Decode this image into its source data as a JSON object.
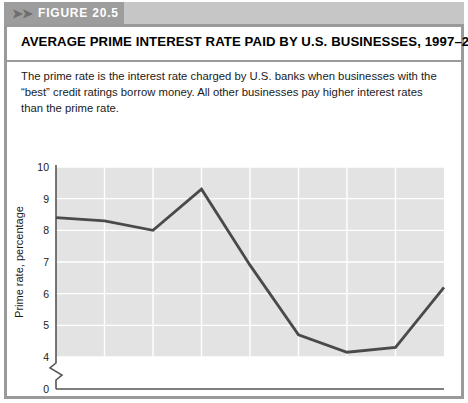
{
  "figure": {
    "badge_chevrons": "➤➤",
    "badge_label": "FIGURE  20.5",
    "title": "AVERAGE PRIME INTEREST RATE PAID BY U.S. BUSINESSES, 1997–2005",
    "caption": "The prime rate is the interest rate charged by U.S. banks when businesses with the “best” credit ratings borrow money. All other businesses pay higher interest rates than the prime rate."
  },
  "colors": {
    "band": "#c6c6c6",
    "badge": "#9d9d9d",
    "border": "#9a9a9a",
    "plot_background": "#e3e3e3",
    "gridline": "#ffffff",
    "line": "#4a4a4a",
    "axis": "#555555",
    "text": "#1a1a1a"
  },
  "chart_data": {
    "type": "line",
    "title": "AVERAGE PRIME INTEREST RATE PAID BY U.S. BUSINESSES, 1997–2005",
    "xlabel": "Year",
    "ylabel": "Prime rate, percentage",
    "x": [
      1997,
      1998,
      1999,
      2000,
      2001,
      2002,
      2003,
      2004,
      2005
    ],
    "categories": [
      "1997",
      "1998",
      "1999",
      "2000",
      "2001",
      "2002",
      "2003",
      "2004",
      "2005"
    ],
    "values": [
      8.4,
      8.3,
      8.0,
      9.3,
      6.9,
      4.7,
      4.15,
      4.3,
      6.2
    ],
    "series": [
      {
        "name": "Prime rate",
        "values": [
          8.4,
          8.3,
          8.0,
          9.3,
          6.9,
          4.7,
          4.15,
          4.3,
          6.2
        ]
      }
    ],
    "xlim": [
      1997,
      2005
    ],
    "ylim": [
      4,
      10
    ],
    "yticks": [
      0,
      4,
      5,
      6,
      7,
      8,
      9,
      10
    ],
    "ytick_labels": [
      "0",
      "4",
      "5",
      "6",
      "7",
      "8",
      "9",
      "10"
    ],
    "xticks": [
      1997,
      1998,
      1999,
      2000,
      2001,
      2002,
      2003,
      2004,
      2005
    ],
    "xtick_labels": [
      "1997",
      "1998",
      "1999",
      "2000",
      "2001",
      "2002",
      "2003",
      "2004",
      "2005"
    ],
    "axis_break": true,
    "axis_break_between": [
      0,
      4
    ],
    "grid": true,
    "grid_color": "#ffffff",
    "legend": false,
    "legend_position": "none"
  }
}
